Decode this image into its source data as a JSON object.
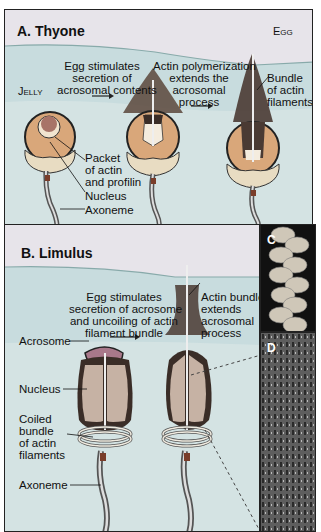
{
  "panel_a": {
    "title": "A. Thyone",
    "egg_label": "Egg",
    "jelly_label": "Jelly",
    "step1": [
      "Egg stimulates",
      "secretion of",
      "acrosomal contents"
    ],
    "step2": [
      "Actin polymerization",
      "extends the",
      "acrosomal",
      "process"
    ],
    "bundle_label": [
      "Bundle",
      "of actin",
      "filaments"
    ],
    "packet_label": [
      "Packet",
      "of actin",
      "and profilin"
    ],
    "nucleus_label": "Nucleus",
    "axoneme_label": "Axoneme"
  },
  "panel_b": {
    "title": "B. Limulus",
    "step1": [
      "Egg stimulates",
      "secretion of acrosome",
      "and uncoiling of actin",
      "filament bundle"
    ],
    "step2": [
      "Actin bundle",
      "extends",
      "acrosomal",
      "process"
    ],
    "acrosome_label": "Acrosome",
    "nucleus_label": "Nucleus",
    "coiled_label": [
      "Coiled",
      "bundle",
      "of actin",
      "filaments"
    ],
    "axoneme_label": "Axoneme"
  },
  "panel_c": {
    "label": "C"
  },
  "panel_d": {
    "label": "D"
  },
  "colors": {
    "jelly": "#c9dde0",
    "egg": "#e6e3ea",
    "sperm_body": "#d9a77a",
    "nucleus": "#c6b2a4",
    "actin": "#4a3a33",
    "midpiece": "#e8dcc2"
  }
}
